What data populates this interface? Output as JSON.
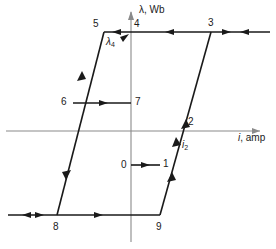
{
  "figure": {
    "type": "hysteresis-loop-diagram",
    "colors": {
      "curve": "#1a1a1a",
      "axis": "#808080",
      "background": "#ffffff"
    },
    "axes": {
      "vertical": {
        "label": "λ, Wb",
        "direction": "up"
      },
      "horizontal": {
        "label_italic": "i",
        "label_rest": ", amp",
        "direction": "right"
      }
    },
    "annotations": {
      "lambda4": {
        "base": "λ",
        "sub": "4"
      },
      "i2": {
        "base": "i",
        "sub": "2"
      }
    },
    "points": [
      {
        "id": "0",
        "label": "0",
        "x": 0,
        "y": 0
      },
      {
        "id": "1",
        "label": "1",
        "x": 0.455,
        "y": 0
      },
      {
        "id": "2",
        "label": "2",
        "x": 0.6,
        "y": 0.345
      },
      {
        "id": "3",
        "label": "3",
        "x": 0.86,
        "y": 0.94
      },
      {
        "id": "4",
        "label": "4",
        "x": 0.0,
        "y": 0.94
      },
      {
        "id": "5",
        "label": "5",
        "x": -0.41,
        "y": 0.94
      },
      {
        "id": "6",
        "label": "6",
        "x": -0.56,
        "y": 0.5
      },
      {
        "id": "7",
        "label": "7",
        "x": 0.0,
        "y": 0.5
      },
      {
        "id": "8",
        "label": "8",
        "x": -0.86,
        "y": -0.85
      },
      {
        "id": "9",
        "label": "9",
        "x": 0.0,
        "y": -0.85
      }
    ]
  }
}
